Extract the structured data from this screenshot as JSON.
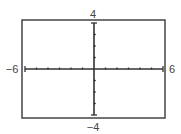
{
  "chart_data": {
    "type": "line",
    "title": "",
    "xlabel": "",
    "ylabel": "",
    "xlim": [
      -6,
      6
    ],
    "ylim": [
      -4,
      4
    ],
    "xscale": 1,
    "yscale": 1,
    "grid": false,
    "legend": null,
    "series": [],
    "tick_labels": {
      "xmin": "−6",
      "xmax": "6",
      "ymin": "−4",
      "ymax": "4"
    }
  },
  "colors": {
    "frame": "#444444",
    "axes": "#333333",
    "labels": "#444444",
    "background": "#ffffff"
  }
}
